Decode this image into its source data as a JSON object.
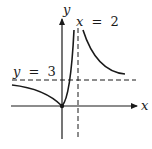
{
  "figure": {
    "type": "function-graph",
    "axes": {
      "x_label": "x",
      "y_label": "y"
    },
    "asymptotes": [
      {
        "kind": "vertical",
        "equation_var": "x",
        "equals": "=",
        "value": "2"
      },
      {
        "kind": "horizontal",
        "equation_var": "y",
        "equals": "=",
        "value": "3"
      }
    ],
    "labels": {
      "vertical_asymptote": "x = 2",
      "horizontal_asymptote": "y = 3"
    },
    "colors": {
      "ink": "#1a1a1a",
      "background": "#ffffff"
    },
    "features": {
      "passes_through_origin": true,
      "origin_point": "(0, 0)"
    }
  }
}
